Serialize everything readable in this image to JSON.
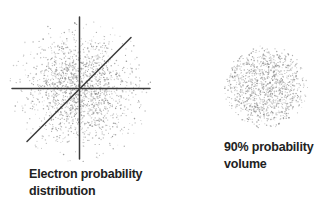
{
  "page": {
    "background_color": "#ffffff",
    "width": 335,
    "height": 206,
    "text_color": "#222222"
  },
  "panels": {
    "distribution": {
      "caption_lines": [
        "Electron probability",
        "distribution"
      ],
      "scatter": {
        "type": "gaussian",
        "seed": 42,
        "count": 1700,
        "center_x": 79.5,
        "center_y": 89,
        "sigma": 27,
        "max_radius": 73,
        "dot_color": "#8f8f8f"
      },
      "axes": {
        "color": "#3a3a3a",
        "vertical": {
          "x": 79.5,
          "y1": 17,
          "y2": 159
        },
        "horizontal": {
          "y": 88.5,
          "x1": 12,
          "x2": 150
        },
        "diagonal": {
          "x1": 27,
          "y1": 141.5,
          "x2": 131,
          "y2": 37.5
        }
      }
    },
    "volume": {
      "caption_lines": [
        "90% probability",
        "volume"
      ],
      "scatter": {
        "type": "uniform-sphere",
        "seed": 7,
        "count": 1150,
        "center_x": 266,
        "center_y": 87,
        "radius": 42,
        "dot_color": "#8f8f8f"
      }
    }
  }
}
